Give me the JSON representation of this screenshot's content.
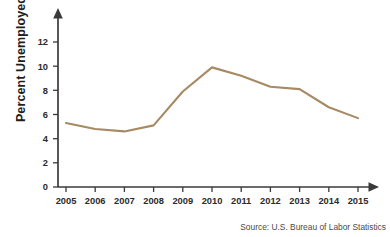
{
  "chart_data": {
    "type": "line",
    "title": "",
    "xlabel": "",
    "ylabel": "Percent Unemployed",
    "categories": [
      "2005",
      "2006",
      "2007",
      "2008",
      "2009",
      "2010",
      "2011",
      "2012",
      "2013",
      "2014",
      "2015"
    ],
    "x": [
      2005,
      2006,
      2007,
      2008,
      2009,
      2010,
      2011,
      2012,
      2013,
      2014,
      2015
    ],
    "values": [
      5.3,
      4.8,
      4.6,
      5.1,
      7.9,
      9.9,
      9.2,
      8.3,
      8.1,
      6.6,
      5.7
    ],
    "series": [
      {
        "name": "Percent Unemployed",
        "values": [
          5.3,
          4.8,
          4.6,
          5.1,
          7.9,
          9.9,
          9.2,
          8.3,
          8.1,
          6.6,
          5.7
        ]
      }
    ],
    "ylim": [
      0,
      13.2
    ],
    "xlim": [
      2005,
      2015
    ],
    "yticks": [
      0,
      2,
      4,
      6,
      8,
      10,
      12
    ],
    "ytick_labels": [
      "0",
      "2",
      "4",
      "6",
      "8",
      "10",
      "12"
    ],
    "xtick_labels": [
      "2005",
      "2006",
      "2007",
      "2008",
      "2009",
      "2010",
      "2011",
      "2012",
      "2013",
      "2014",
      "2015"
    ],
    "grid": false,
    "legend": false,
    "legend_position": "none",
    "line_color": "#a78a63",
    "axis_color": "#3a3a3a",
    "annotations": [
      "Source: U.S. Bureau of Labor Statistics"
    ]
  },
  "figure": {
    "source_note": "Source: U.S. Bureau of Labor Statistics",
    "y_axis_title": "Percent Unemployed",
    "background_color": "#ffffff"
  }
}
